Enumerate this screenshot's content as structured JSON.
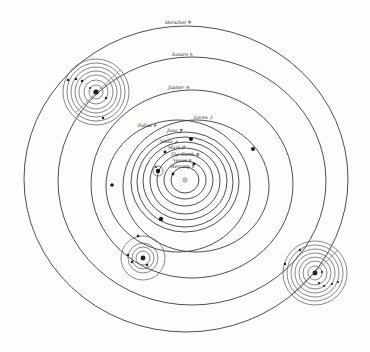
{
  "diagram": {
    "center": "Sun",
    "labels": {
      "herschel": "Herschel ♅",
      "saturn": "Saturn ♄",
      "jupiter": "Jupiter ♃",
      "pallas": "Pallas ⚴",
      "ceres": "Ceres ⚳",
      "juno": "Juno ⚵",
      "vesta": "Vesta ⚶",
      "mars": "Mars ♂",
      "earth": "The Earth ⊕",
      "venus": "Venus ♀",
      "mercury": "Mercury ☿"
    },
    "orbits_outer_to_inner": [
      "Herschel",
      "Saturn",
      "Jupiter",
      "Pallas",
      "Ceres",
      "Juno",
      "Vesta",
      "Mars",
      "The Earth",
      "Venus",
      "Mercury"
    ],
    "satellite_systems": [
      {
        "planet": "Saturn",
        "moons_visible": 7
      },
      {
        "planet": "Jupiter",
        "moons_visible": 4
      },
      {
        "planet": "Herschel",
        "moons_visible": 6
      },
      {
        "planet": "The Earth",
        "moons_visible": 1
      }
    ],
    "colors": {
      "background": "#fdfdfb",
      "ink": "#2a2a2a"
    }
  }
}
